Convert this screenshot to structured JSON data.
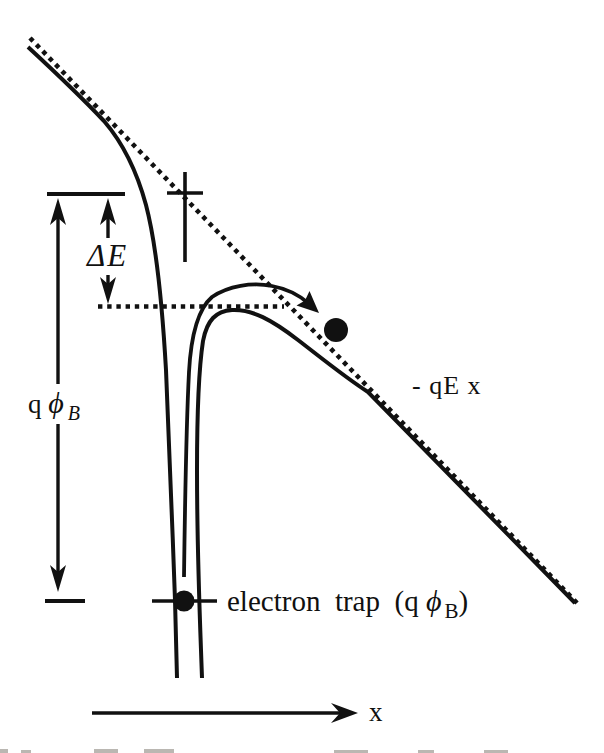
{
  "figure": {
    "colors": {
      "ink": "#111111",
      "background": "#ffffff"
    },
    "labels": {
      "delta_e": {
        "delta": "Δ",
        "e": "E"
      },
      "q_phi_b": {
        "q": "q",
        "phi": "ϕ",
        "sub": "B"
      },
      "field_line": "- qE x",
      "trap": {
        "pre": "electron  trap  (q ",
        "phi": "ϕ",
        "sub": "B",
        "post": ")"
      },
      "x_axis": "x"
    }
  }
}
